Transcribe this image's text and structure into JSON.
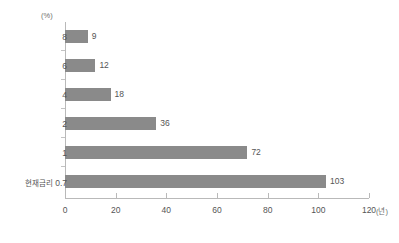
{
  "chart_data": {
    "type": "bar",
    "orientation": "horizontal",
    "title": "",
    "subtitle": "",
    "xlabel": "(년)",
    "ylabel": "(%)",
    "categories": [
      "8",
      "6",
      "4",
      "2",
      "1",
      "0.7"
    ],
    "category_prefix_last": "현재금리",
    "values": [
      9,
      12,
      18,
      36,
      72,
      103
    ],
    "value_labels": [
      "9",
      "12",
      "18",
      "36",
      "72",
      "103"
    ],
    "xlim": [
      0,
      120
    ],
    "xticks": [
      0,
      20,
      40,
      60,
      80,
      100,
      120
    ],
    "xtick_labels": [
      "0",
      "20",
      "40",
      "60",
      "80",
      "100",
      "120"
    ],
    "grid": false,
    "legend": null,
    "bars": [
      {
        "category": "8",
        "label": "8",
        "value": 9,
        "value_label": "9"
      },
      {
        "category": "6",
        "label": "6",
        "value": 12,
        "value_label": "12"
      },
      {
        "category": "4",
        "label": "4",
        "value": 18,
        "value_label": "18"
      },
      {
        "category": "2",
        "label": "2",
        "value": 36,
        "value_label": "36"
      },
      {
        "category": "1",
        "label": "1",
        "value": 72,
        "value_label": "72"
      },
      {
        "category": "0.7",
        "label": "0.7",
        "prefix": "현재금리",
        "value": 103,
        "value_label": "103"
      }
    ],
    "colors": {
      "bar": "#8a8a8a",
      "axis": "#b9b9b9",
      "text": "#555555",
      "unit_text": "#6d6d6d",
      "background": "#ffffff"
    }
  }
}
